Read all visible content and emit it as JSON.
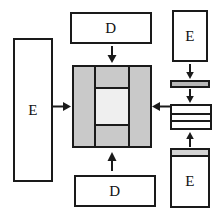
{
  "diagram": {
    "background_color": "#ffffff",
    "stroke_color": "#1a1a1a",
    "fill_gray": "#c9c9c9",
    "fill_light_gray": "#efefef",
    "nodes": {
      "left_e": {
        "label": "E",
        "shape": "tall-rectangle",
        "fill": "#ffffff"
      },
      "top_d": {
        "label": "D",
        "shape": "wide-rectangle",
        "fill": "#ffffff"
      },
      "bottom_d": {
        "label": "D",
        "shape": "wide-rectangle",
        "fill": "#ffffff"
      },
      "right_e_top": {
        "label": "E",
        "shape": "rectangle",
        "fill": "#ffffff"
      },
      "right_e_bottom": {
        "label": "E",
        "shape": "rectangle",
        "fill": "#ffffff"
      },
      "right_bar": {
        "label": "",
        "shape": "thin-bar",
        "fill": "#b8b8b8"
      },
      "right_stack": {
        "label": "",
        "shape": "banded-rectangle",
        "fill": "#ffffff",
        "bands": 3
      },
      "center": {
        "label": "",
        "shape": "composite-square",
        "fill": "#c9c9c9",
        "core_fill": "#efefef"
      }
    },
    "arrows": [
      {
        "name": "arrow-top-d-to-center",
        "direction": "down"
      },
      {
        "name": "arrow-left-e-to-center",
        "direction": "right"
      },
      {
        "name": "arrow-right-stack-to-center",
        "direction": "left"
      },
      {
        "name": "arrow-bottom-d-to-center",
        "direction": "up"
      },
      {
        "name": "arrow-right-e-top-to-bar",
        "direction": "down"
      },
      {
        "name": "arrow-bar-to-stack",
        "direction": "down"
      },
      {
        "name": "arrow-right-e-bottom-to-stack",
        "direction": "up"
      }
    ]
  }
}
